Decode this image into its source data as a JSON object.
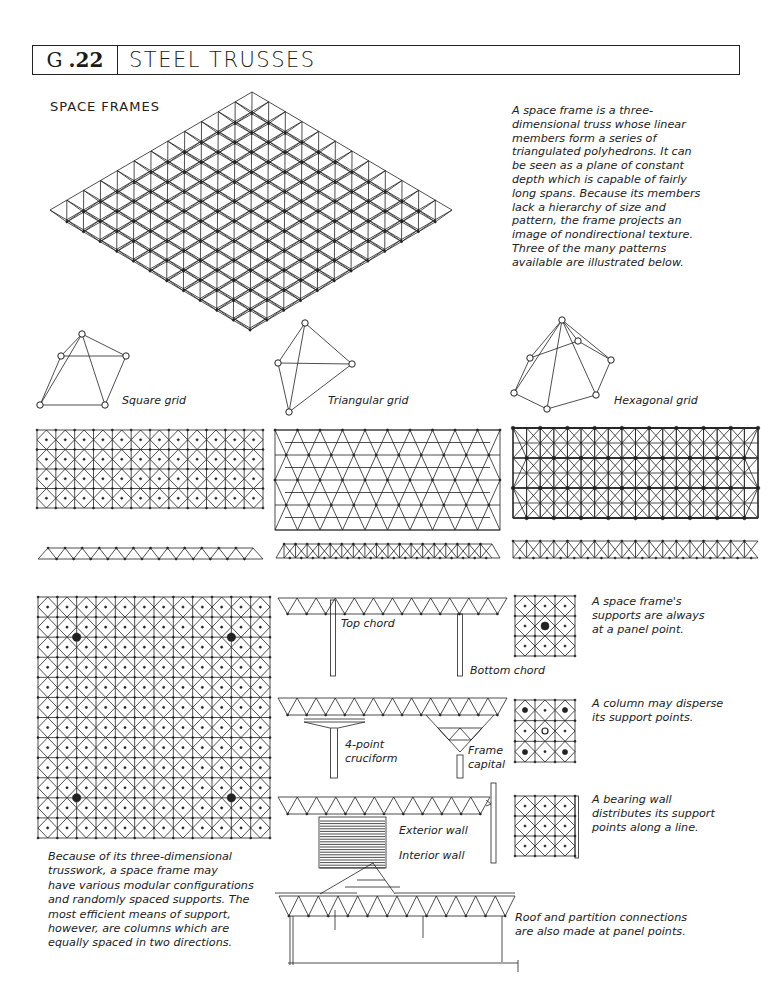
{
  "header": {
    "section_glyph": "G",
    "section_number": ".22",
    "title": "STEEL TRUSSES"
  },
  "space_frames": {
    "heading": "SPACE FRAMES",
    "intro_text": [
      "A space frame is a three-",
      "dimensional truss whose linear",
      "members form a series of",
      "triangulated polyhedrons. It can",
      "be seen as a plane of constant",
      "depth which is capable of fairly",
      "long spans. Because its members",
      "lack a hierarchy of size and",
      "pattern, the frame projects an",
      "image of nondirectional texture.",
      "Three of the many patterns",
      "available are illustrated below."
    ],
    "isometric_grid_modules": 12
  },
  "patterns": [
    {
      "label": "Square grid",
      "module_shape": "square-pyramid",
      "plan_cols": 12,
      "plan_rows": 4,
      "section_bays": 12
    },
    {
      "label": "Triangular grid",
      "module_shape": "tetrahedron",
      "plan_cols": 10,
      "plan_rows": 4,
      "section_bays": 18
    },
    {
      "label": "Hexagonal grid",
      "module_shape": "hexagonal-pyramid",
      "plan_cols": 18,
      "plan_rows": 6,
      "section_bays": 18
    }
  ],
  "large_plan": {
    "grid_modules": 12,
    "column_positions": [
      [
        2,
        2
      ],
      [
        10,
        2
      ],
      [
        2,
        10
      ],
      [
        10,
        10
      ]
    ],
    "caption": [
      "Because of its three-dimensional",
      "trusswork, a space frame may",
      "have various modular configurations",
      "and randomly spaced supports. The",
      "most efficient means of support,",
      "however, are columns which are",
      "equally spaced in two directions."
    ]
  },
  "sections": {
    "chord_labels": {
      "top": "Top chord",
      "bottom": "Bottom chord"
    },
    "column_labels": {
      "cruciform": "4-point\ncruciform",
      "capital": "Frame\ncapital"
    },
    "wall_labels": {
      "exterior": "Exterior wall",
      "interior": "Interior wall"
    },
    "roof_caption": [
      "Roof and partition connections",
      "are also made at panel points."
    ]
  },
  "support_notes": [
    {
      "text": [
        "A space frame's",
        "supports are always",
        "at a panel point."
      ],
      "support_type": "single-point"
    },
    {
      "text": [
        "A column may disperse",
        "its support points."
      ],
      "support_type": "dispersed"
    },
    {
      "text": [
        "A bearing wall",
        "distributes its support",
        "points along a line."
      ],
      "support_type": "wall"
    }
  ]
}
